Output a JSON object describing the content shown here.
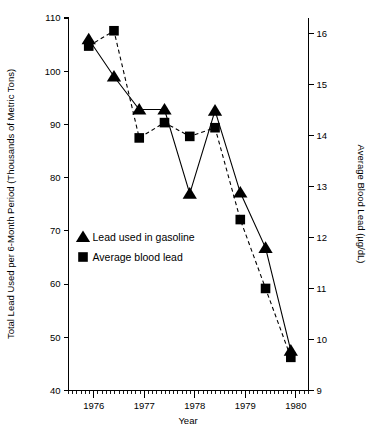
{
  "chart_data": {
    "type": "line",
    "title": "",
    "subtitle": "",
    "xlabel": "Year",
    "ylabel": "Total Lead Used per 6-Month Period (Thousands of Metric Tons)",
    "y2label": "Average Blood Lead (µg/dL)",
    "grid": false,
    "legend_position": "inside-lower-left",
    "xlim": [
      1975.5,
      1980.25
    ],
    "x_major_ticks": [
      1976,
      1977,
      1978,
      1979,
      1980
    ],
    "x_major_tick_labels": [
      "1976",
      "1977",
      "1978",
      "1979",
      "1980"
    ],
    "x_minor_tick_interval": 0.0833,
    "ylim": [
      40,
      110
    ],
    "y_ticks": [
      40,
      50,
      60,
      70,
      80,
      90,
      100,
      110
    ],
    "y_tick_labels": [
      "40",
      "50",
      "60",
      "70",
      "80",
      "90",
      "100",
      "110"
    ],
    "y2lim": [
      9,
      16.3
    ],
    "y2_ticks": [
      9,
      10,
      11,
      12,
      13,
      14,
      15,
      16
    ],
    "y2_tick_labels": [
      "9",
      "10",
      "11",
      "12",
      "13",
      "14",
      "15",
      "16"
    ],
    "series": [
      {
        "name": "Lead used in gasoline",
        "axis": "left",
        "marker": "triangle",
        "linestyle": "solid",
        "color": "#000000",
        "x": [
          1975.9,
          1976.4,
          1976.9,
          1977.4,
          1977.9,
          1978.4,
          1978.9,
          1979.4,
          1979.9
        ],
        "values": [
          106.0,
          99.0,
          92.8,
          92.8,
          77.0,
          92.6,
          77.2,
          66.8,
          47.5
        ]
      },
      {
        "name": "Average blood lead",
        "axis": "right",
        "marker": "square",
        "linestyle": "dashed",
        "color": "#000000",
        "x": [
          1975.9,
          1976.4,
          1976.9,
          1977.4,
          1977.9,
          1978.4,
          1978.9,
          1979.4,
          1979.9
        ],
        "values": [
          15.75,
          16.05,
          13.95,
          14.25,
          13.98,
          14.15,
          12.35,
          11.0,
          9.65
        ],
        "values_left_axis_equivalent": [
          103.2,
          106.3,
          85.6,
          90.4,
          85.9,
          89.2,
          71.8,
          59.0,
          46.0
        ]
      }
    ],
    "legend_entries": [
      {
        "label": "Lead used in gasoline",
        "marker": "triangle"
      },
      {
        "label": "Average blood lead",
        "marker": "square"
      }
    ]
  }
}
